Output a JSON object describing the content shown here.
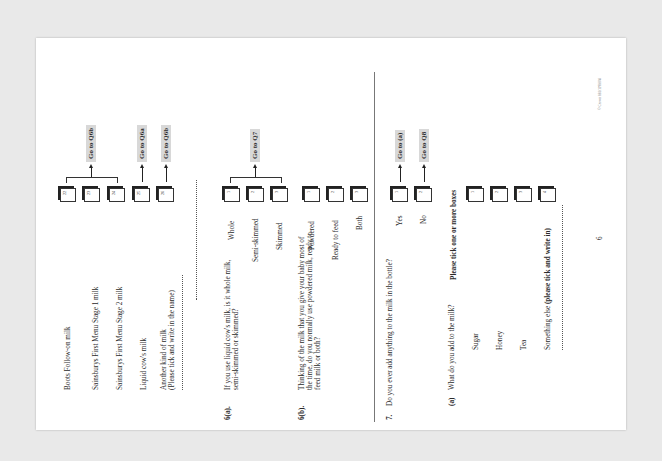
{
  "q5_continued": {
    "options": [
      {
        "label": "Boots Follow-on milk",
        "code": "22"
      },
      {
        "label": "Sainsburys First Menu Stage 1 milk",
        "code": "23"
      },
      {
        "label": "Sainsburys First Menu Stage 2 milk",
        "code": "24"
      },
      {
        "label": "Liquid cow's milk",
        "code": "25"
      },
      {
        "label": "Another kind of milk",
        "label2": "(Please tick and write in the name)",
        "code": "26"
      }
    ],
    "goto_group": "Go to Q6b",
    "goto_liquid": "Go to Q6a",
    "goto_another": "Go to Q6b"
  },
  "q6a": {
    "number": "6(a).",
    "text1": "If you use liquid cow's milk, is it whole milk,",
    "text2": "semi-skimmed or skimmed?",
    "options": [
      {
        "label": "Whole",
        "code": "1"
      },
      {
        "label": "Semi-skimmed",
        "code": "2"
      },
      {
        "label": "Skimmed",
        "code": "3"
      }
    ],
    "goto": "Go to Q7"
  },
  "q6b": {
    "number": "6(b).",
    "text1": "Thinking of the milk that you give your baby most of",
    "text2": "the time, do you normally use powdered milk, ready to",
    "text3": "feed milk or both?",
    "options": [
      {
        "label": "Powdered",
        "code": "1"
      },
      {
        "label": "Ready to feed",
        "code": "2"
      },
      {
        "label": "Both",
        "code": "3"
      }
    ]
  },
  "q7": {
    "number": "7.",
    "text": "Do you ever add anything to the milk in the bottle?",
    "options": [
      {
        "label": "Yes",
        "code": "1",
        "goto": "Go to (a)"
      },
      {
        "label": "No",
        "code": "2",
        "goto": "Go to Q8"
      }
    ],
    "sub_a": {
      "number": "(a)",
      "text": "What do you add to the milk?",
      "instruction": "Please tick one or more boxes",
      "options": [
        {
          "label": "Sugar",
          "code": "1"
        },
        {
          "label": "Honey",
          "code": "2"
        },
        {
          "label": "Tea",
          "code": "3"
        },
        {
          "label": "Something else ",
          "label_bold": "(please tick and write in)",
          "code": "4"
        }
      ]
    }
  },
  "footer": {
    "page_number": "6",
    "copyright": "© Crown 881/1198/04"
  }
}
